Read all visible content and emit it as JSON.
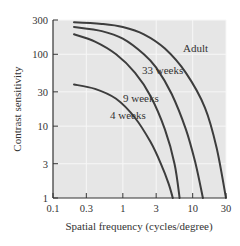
{
  "chart_data": {
    "type": "line",
    "title": "",
    "xlabel": "Spatial frequency (cycles/degree)",
    "ylabel": "Contrast sensitivity",
    "xscale": "log",
    "yscale": "log",
    "xlim": [
      0.1,
      30
    ],
    "ylim": [
      1,
      300
    ],
    "xticks": [
      "0.1",
      "0.3",
      "1",
      "3",
      "10",
      "30"
    ],
    "yticks": [
      "1",
      "3",
      "10",
      "30",
      "100",
      "300"
    ],
    "grid": true,
    "legend": "inline labels",
    "series": [
      {
        "name": "Adult",
        "x": [
          0.2,
          0.5,
          1,
          2,
          4,
          8,
          15,
          22,
          30
        ],
        "y": [
          280,
          265,
          240,
          190,
          120,
          55,
          18,
          5,
          1
        ]
      },
      {
        "name": "33 weeks",
        "x": [
          0.2,
          0.5,
          1,
          2,
          3,
          5,
          8,
          11,
          14
        ],
        "y": [
          240,
          210,
          165,
          100,
          65,
          28,
          9,
          3,
          1
        ]
      },
      {
        "name": "9 weeks",
        "x": [
          0.2,
          0.4,
          0.8,
          1.5,
          2.5,
          4,
          5.5,
          6.5
        ],
        "y": [
          190,
          150,
          100,
          55,
          26,
          9,
          3,
          1
        ]
      },
      {
        "name": "4 weeks",
        "x": [
          0.2,
          0.4,
          0.8,
          1.5,
          2.5,
          3.5,
          4.5,
          5.2
        ],
        "y": [
          38,
          33,
          24,
          13,
          6,
          3,
          1.6,
          1
        ]
      }
    ]
  },
  "labels": {
    "adult": "Adult",
    "w33": "33 weeks",
    "w9": "9 weeks",
    "w4": "4 weeks"
  },
  "colors": {
    "plot_background": "#e6e6e6",
    "gridline": "#f7f7f7",
    "curve": "#3d3d3d",
    "axis": "#333333"
  }
}
